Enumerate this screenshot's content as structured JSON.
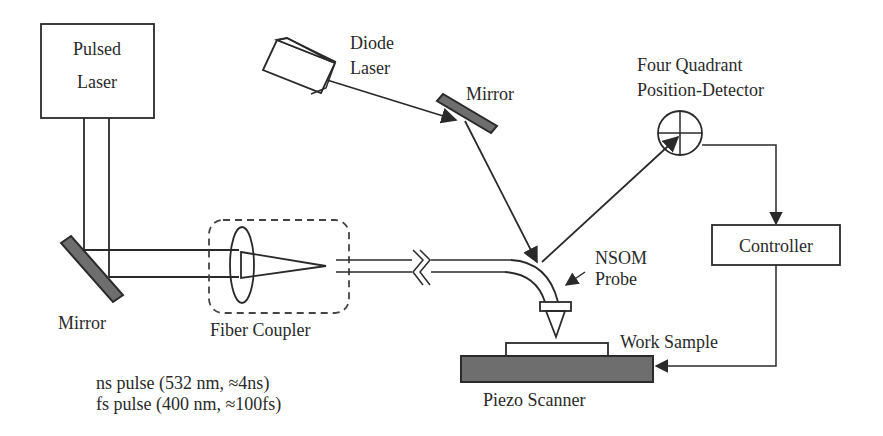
{
  "components": {
    "pulsed_laser": {
      "line1": "Pulsed",
      "line2": "Laser"
    },
    "diode_laser": {
      "line1": "Diode",
      "line2": "Laser"
    },
    "mirror_top": {
      "label": "Mirror"
    },
    "mirror_left": {
      "label": "Mirror"
    },
    "detector": {
      "line1": "Four Quadrant",
      "line2": "Position-Detector"
    },
    "controller": {
      "label": "Controller"
    },
    "fiber_coupler": {
      "label": "Fiber Coupler"
    },
    "nsom_probe": {
      "line1": "NSOM",
      "line2": "Probe"
    },
    "work_sample": {
      "label": "Work Sample"
    },
    "piezo_scanner": {
      "label": "Piezo Scanner"
    }
  },
  "pulse_notes": [
    "ns pulse (532 nm, ≈4ns)",
    "fs pulse (400 nm, ≈100fs)"
  ],
  "colors": {
    "line": "#2a2a2a",
    "mirror_fill": "#6e6e6e",
    "background": "#ffffff"
  }
}
